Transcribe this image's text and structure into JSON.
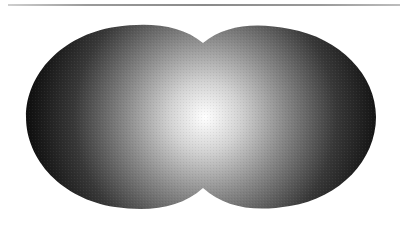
{
  "figure": {
    "top_rule": {
      "color": "#8f8f8f",
      "x1": 8,
      "x2": 400,
      "y": 5
    },
    "shape": {
      "left_lobe": {
        "cx": 115,
        "cy": 117,
        "r": 90
      },
      "right_lobe": {
        "cx": 289,
        "cy": 117,
        "r": 88
      },
      "gradient": {
        "center_x": 205,
        "center_y": 117,
        "stops": [
          {
            "offset": "0%",
            "color": "#ffffff"
          },
          {
            "offset": "25%",
            "color": "#c8c8c8"
          },
          {
            "offset": "55%",
            "color": "#7a7a7a"
          },
          {
            "offset": "85%",
            "color": "#2e2e2e"
          },
          {
            "offset": "100%",
            "color": "#111111"
          }
        ]
      }
    },
    "background": "#ffffff"
  }
}
